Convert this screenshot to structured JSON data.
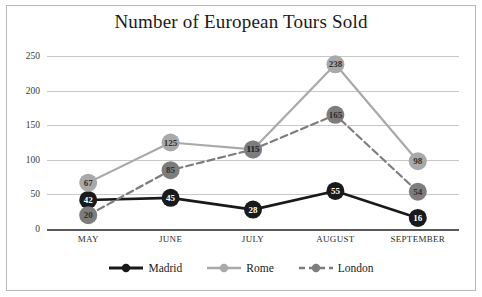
{
  "chart_data": {
    "type": "line",
    "title": "Number of European Tours Sold",
    "xlabel": "",
    "ylabel": "",
    "categories": [
      "MAY",
      "JUNE",
      "JULY",
      "AUGUST",
      "SEPTEMBER"
    ],
    "yticks": [
      0,
      50,
      100,
      150,
      200,
      250
    ],
    "ylim": [
      0,
      250
    ],
    "grid": true,
    "legend_position": "bottom",
    "series": [
      {
        "name": "Madrid",
        "values": [
          42,
          45,
          28,
          55,
          16
        ],
        "color": "#1a1a1a",
        "line_style": "solid",
        "label_color": "on-dark"
      },
      {
        "name": "Rome",
        "values": [
          67,
          125,
          115,
          238,
          98
        ],
        "color": "#a9a9a9",
        "line_style": "solid",
        "label_color": "on-light"
      },
      {
        "name": "London",
        "values": [
          20,
          85,
          115,
          165,
          54
        ],
        "color": "#7d7d7d",
        "line_style": "dashed",
        "label_color": "on-light"
      }
    ]
  }
}
